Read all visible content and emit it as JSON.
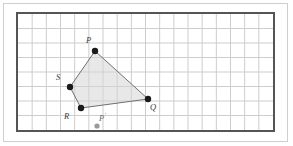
{
  "figure": {
    "type": "geometry-diagram",
    "background_color": "#ffffff",
    "outer_border_color": "#cfcfcf",
    "grid": {
      "frame_color": "#555555",
      "minor_line_color": "#cccccc",
      "cell_size_px": 14.35,
      "columns": 18,
      "rows": 8,
      "origin_px": {
        "x": 16,
        "y": 12
      },
      "width_px": 259,
      "height_px": 120
    },
    "polygon": {
      "name": "PQRS",
      "fill_color": "#d6d6d6",
      "fill_opacity": "0.55",
      "stroke_color": "#707070",
      "stroke_width": 1,
      "vertex_order": [
        "P",
        "Q",
        "R",
        "S"
      ]
    },
    "points": [
      {
        "id": "P",
        "label": "P",
        "label_sup": "",
        "x": 95,
        "y": 51,
        "grid_x": 5.5,
        "grid_y": 2.7,
        "color": "#1a1a1a",
        "radius": 3.2,
        "label_x": 86,
        "label_y": 36,
        "kind": "vertex"
      },
      {
        "id": "Q",
        "label": "Q",
        "label_sup": "",
        "x": 148,
        "y": 99,
        "grid_x": 9.2,
        "grid_y": 6.1,
        "color": "#1a1a1a",
        "radius": 3.2,
        "label_x": 150,
        "label_y": 103,
        "kind": "vertex"
      },
      {
        "id": "R",
        "label": "R",
        "label_sup": "",
        "x": 81,
        "y": 108,
        "grid_x": 4.5,
        "grid_y": 6.7,
        "color": "#1a1a1a",
        "radius": 3.2,
        "label_x": 64,
        "label_y": 112,
        "kind": "vertex"
      },
      {
        "id": "S",
        "label": "S",
        "label_sup": "",
        "x": 70,
        "y": 87,
        "grid_x": 3.8,
        "grid_y": 5.2,
        "color": "#1a1a1a",
        "radius": 3.2,
        "label_x": 56,
        "label_y": 73,
        "kind": "vertex"
      },
      {
        "id": "Pp",
        "label": "P",
        "label_sup": "'",
        "x": 97,
        "y": 126,
        "grid_x": 5.6,
        "grid_y": 7.9,
        "color": "#9a9a9a",
        "radius": 2.6,
        "label_x": 99,
        "label_y": 112,
        "kind": "image-point"
      }
    ]
  }
}
